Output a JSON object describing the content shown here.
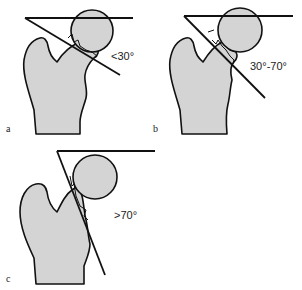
{
  "figure": {
    "panels": [
      {
        "id": "a",
        "letter": "a",
        "angle_label": "<30°"
      },
      {
        "id": "b",
        "letter": "b",
        "angle_label": "30°-70°"
      },
      {
        "id": "c",
        "letter": "c",
        "angle_label": ">70°"
      }
    ]
  },
  "colors": {
    "bone_fill": "#d4d4d4",
    "stroke": "#111111",
    "background": "#ffffff"
  }
}
